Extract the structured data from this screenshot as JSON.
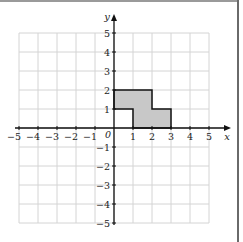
{
  "diagram": {
    "type": "coordinate-grid",
    "axes": {
      "x_label": "x",
      "y_label": "y",
      "origin_label": "0",
      "x_ticks": [
        "−5",
        "−4",
        "−3",
        "−2",
        "−1",
        "1",
        "2",
        "3",
        "4",
        "5"
      ],
      "y_ticks": [
        "5",
        "4",
        "3",
        "2",
        "1",
        "−1",
        "−2",
        "−3",
        "−4",
        "−5"
      ],
      "x_range": [
        -5,
        5
      ],
      "y_range": [
        -5,
        5
      ]
    },
    "shape": {
      "description": "shaded L/step polygon",
      "vertices": [
        [
          0,
          2
        ],
        [
          2,
          2
        ],
        [
          2,
          1
        ],
        [
          3,
          1
        ],
        [
          3,
          0
        ],
        [
          1,
          0
        ],
        [
          1,
          1
        ],
        [
          0,
          1
        ]
      ],
      "fill": "#c8c8c8",
      "stroke": "#111111"
    },
    "colors": {
      "grid": "#d4d4d4",
      "axis": "#111111",
      "background": "#ffffff"
    }
  }
}
